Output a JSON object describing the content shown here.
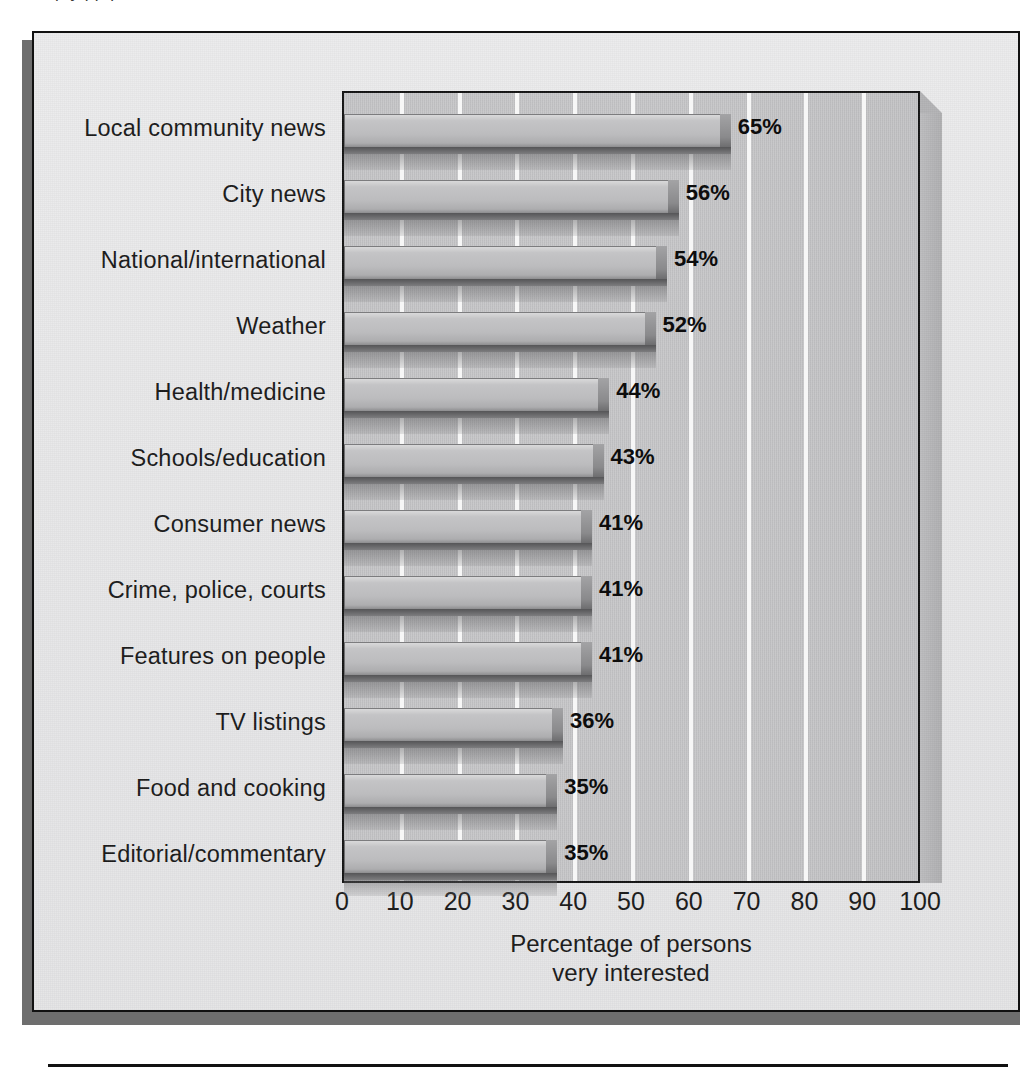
{
  "figure": {
    "clipped_top_text": "p                                                      y        pp                            p",
    "background_color": "#e8e8e9",
    "frame_border_color": "#111111",
    "shadow_color": "#6e6e6e"
  },
  "chart_data": {
    "type": "bar",
    "orientation": "horizontal",
    "title": "",
    "subtitle": "",
    "xlabel": "Percentage of persons very interested",
    "xlabel_lines": [
      "Percentage of persons",
      "very interested"
    ],
    "ylabel": "",
    "categories": [
      "Local community news",
      "City news",
      "National/international",
      "Weather",
      "Health/medicine",
      "Schools/education",
      "Consumer news",
      "Crime, police, courts",
      "Features on people",
      "TV listings",
      "Food and cooking",
      "Editorial/commentary"
    ],
    "values": [
      65,
      56,
      54,
      52,
      44,
      43,
      41,
      41,
      41,
      36,
      35,
      35
    ],
    "data_labels": [
      "65%",
      "56%",
      "54%",
      "52%",
      "44%",
      "43%",
      "41%",
      "41%",
      "41%",
      "36%",
      "35%",
      "35%"
    ],
    "xlim": [
      0,
      100
    ],
    "xticks": [
      0,
      10,
      20,
      30,
      40,
      50,
      60,
      70,
      80,
      90,
      100
    ],
    "xtick_labels": [
      "0",
      "10",
      "20",
      "30",
      "40",
      "50",
      "60",
      "70",
      "80",
      "90",
      "100"
    ],
    "grid": "vertical-major-white",
    "legend": "none",
    "style_3d": true,
    "plot_background_color": "#c9c9cb",
    "gridline_color": "#f7f7f7",
    "bar_face_color": "#bcbcbe",
    "bar_edge_color": "#6f6f71",
    "value_label_color": "#0d0d0d"
  }
}
